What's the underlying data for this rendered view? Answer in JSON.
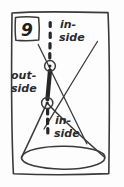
{
  "figure": {
    "number_label": "9",
    "caption_texts": {
      "top_line1": "in-",
      "top_line2": "side",
      "left_line1": "out-",
      "left_line2": "side",
      "bottom_line1": "in-",
      "bottom_line2": "side"
    },
    "colors": {
      "ink": "#3a3a3a",
      "ink_dark": "#262626",
      "paper": "#fdfdfd",
      "text": "#2b2b2b"
    },
    "elements": {
      "frame_name": "hand-drawn-border",
      "cone_name": "cone-shape",
      "base_ellipse_name": "cone-base-ellipse",
      "secant_line_name": "secant-line",
      "dashed_axis_name": "dashed-axis-line",
      "upper_point_name": "upper-intersection-point",
      "lower_point_name": "lower-intersection-point",
      "chord_name": "chord-segment"
    },
    "geometry": {
      "upper_point": [
        50,
        66
      ],
      "lower_point": [
        47,
        103
      ],
      "cone_apex": [
        47,
        103
      ],
      "base_center": [
        63,
        158
      ],
      "base_rx": 43,
      "base_ry": 13
    }
  }
}
